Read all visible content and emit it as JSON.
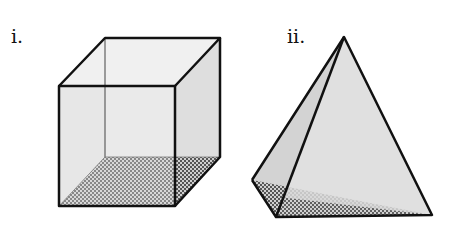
{
  "figures": [
    {
      "label": "i.",
      "shape": "cube",
      "shaded_face": "bottom"
    },
    {
      "label": "ii.",
      "shape": "triangular-pyramid",
      "shaded_face": "base"
    }
  ],
  "colors": {
    "edge": "#111111",
    "face": "#e4e4e4",
    "face_dark": "#d0d0d0",
    "hatch_dark": "#555555",
    "hatch_light": "#cfcfcf",
    "hidden_edge": "#444444"
  }
}
